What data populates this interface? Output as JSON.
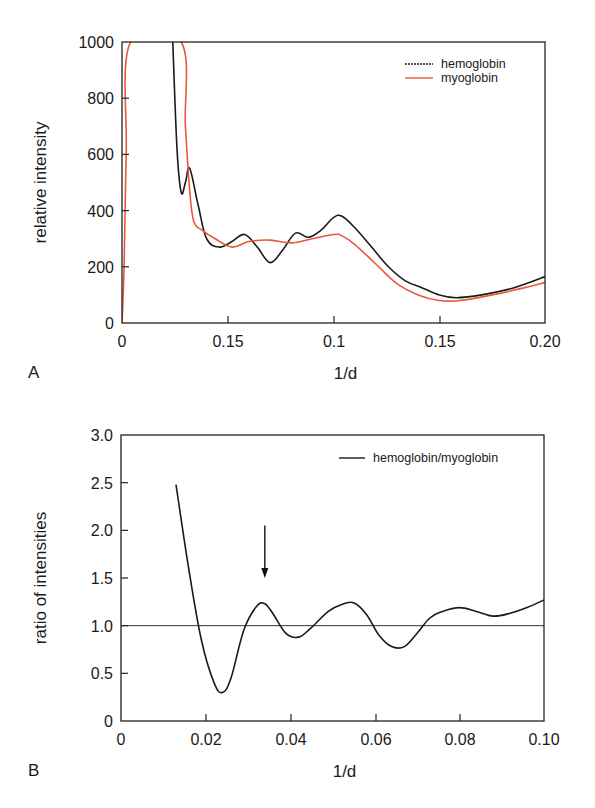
{
  "panel_a": {
    "label": "A",
    "xlabel": "1/d",
    "ylabel": "relative intensity",
    "xticks": [
      "0",
      "0.15",
      "0.1",
      "0.15",
      "0.20"
    ],
    "yticks": [
      "0",
      "200",
      "400",
      "600",
      "800",
      "1000"
    ],
    "legend": [
      "hemoglobin",
      "myoglobin"
    ]
  },
  "panel_b": {
    "label": "B",
    "xlabel": "1/d",
    "ylabel": "ratio of intensities",
    "xticks": [
      "0",
      "0.02",
      "0.04",
      "0.06",
      "0.08",
      "0.10"
    ],
    "yticks": [
      "0",
      "0.5",
      "1.0",
      "1.5",
      "2.0",
      "2.5",
      "3.0"
    ],
    "legend": [
      "hemoglobin/myoglobin"
    ]
  },
  "colors": {
    "hemoglobin": "#1a1a1a",
    "myoglobin": "#e8583a",
    "ratio": "#1a1a1a"
  },
  "chart_data": [
    {
      "type": "line",
      "title": "",
      "xlabel": "1/d",
      "ylabel": "relative intensity",
      "xlim": [
        0,
        0.2
      ],
      "ylim": [
        0,
        1000
      ],
      "x_tick_labels": [
        "0",
        "0.15",
        "0.1",
        "0.15",
        "0.20"
      ],
      "legend_position": "upper right",
      "grid": false,
      "series": [
        {
          "name": "hemoglobin",
          "x": [
            0.024,
            0.026,
            0.028,
            0.03,
            0.032,
            0.036,
            0.04,
            0.046,
            0.052,
            0.058,
            0.064,
            0.07,
            0.076,
            0.082,
            0.088,
            0.094,
            0.1,
            0.104,
            0.11,
            0.118,
            0.126,
            0.134,
            0.142,
            0.15,
            0.158,
            0.17,
            0.185,
            0.2
          ],
          "y": [
            1000,
            620,
            465,
            500,
            550,
            420,
            300,
            270,
            290,
            315,
            270,
            215,
            260,
            320,
            305,
            330,
            375,
            380,
            340,
            270,
            200,
            150,
            125,
            100,
            90,
            100,
            125,
            165
          ]
        },
        {
          "name": "myoglobin",
          "x": [
            0.0,
            0.001,
            0.002,
            0.004,
            0.028,
            0.03,
            0.032,
            0.034,
            0.038,
            0.044,
            0.052,
            0.06,
            0.07,
            0.08,
            0.09,
            0.1,
            0.104,
            0.11,
            0.12,
            0.13,
            0.14,
            0.15,
            0.16,
            0.175,
            0.19,
            0.2
          ],
          "y": [
            0,
            200,
            600,
            1000,
            1000,
            700,
            470,
            360,
            330,
            300,
            270,
            290,
            295,
            285,
            300,
            315,
            310,
            280,
            210,
            140,
            100,
            80,
            80,
            100,
            125,
            145
          ]
        }
      ]
    },
    {
      "type": "line",
      "title": "",
      "xlabel": "1/d",
      "ylabel": "ratio of intensities",
      "xlim": [
        0,
        0.1
      ],
      "ylim": [
        0,
        3.0
      ],
      "legend_position": "upper right",
      "grid": false,
      "reference_line": {
        "y": 1.0
      },
      "annotations": [
        {
          "type": "arrow",
          "x": 0.034,
          "y_from": 2.05,
          "y_to": 1.5
        }
      ],
      "series": [
        {
          "name": "hemoglobin/myoglobin",
          "x": [
            0.013,
            0.016,
            0.019,
            0.022,
            0.024,
            0.026,
            0.029,
            0.032,
            0.034,
            0.036,
            0.039,
            0.042,
            0.045,
            0.049,
            0.052,
            0.055,
            0.058,
            0.061,
            0.064,
            0.067,
            0.07,
            0.073,
            0.076,
            0.08,
            0.084,
            0.088,
            0.092,
            0.096,
            0.1
          ],
          "y": [
            2.48,
            1.6,
            0.85,
            0.4,
            0.3,
            0.45,
            0.95,
            1.2,
            1.23,
            1.12,
            0.92,
            0.88,
            0.98,
            1.15,
            1.22,
            1.24,
            1.12,
            0.9,
            0.78,
            0.78,
            0.92,
            1.08,
            1.15,
            1.19,
            1.15,
            1.1,
            1.13,
            1.19,
            1.27
          ]
        }
      ]
    }
  ]
}
